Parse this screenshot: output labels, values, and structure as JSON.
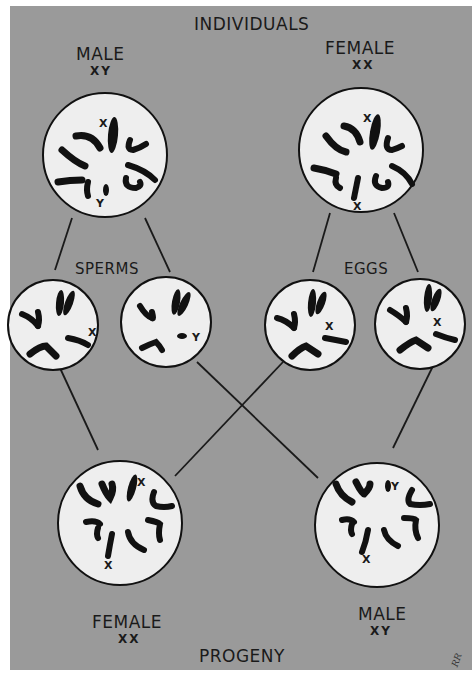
{
  "title": "INDIVIDUALS",
  "parents": {
    "male": {
      "label": "MALE",
      "genotype": "XY",
      "cell_x_label": "X",
      "cell_y_label": "Y"
    },
    "female": {
      "label": "FEMALE",
      "genotype": "XX",
      "cell_x1_label": "X",
      "cell_x2_label": "X"
    }
  },
  "gametes": {
    "sperms_label": "SPERMS",
    "eggs_label": "EGGS",
    "sperm_x": {
      "chromosome": "X"
    },
    "sperm_y": {
      "chromosome": "Y"
    },
    "egg_1": {
      "chromosome": "X"
    },
    "egg_2": {
      "chromosome": "X"
    }
  },
  "progeny": {
    "title": "PROGENY",
    "female": {
      "label": "FEMALE",
      "genotype": "XX",
      "cell_x1_label": "X",
      "cell_x2_label": "X"
    },
    "male": {
      "label": "MALE",
      "genotype": "XY",
      "cell_x_label": "X",
      "cell_y_label": "Y"
    }
  },
  "signature": "RR",
  "colors": {
    "background": "#9a9a9a",
    "cell": "#eeeeee",
    "ink": "#111111"
  }
}
